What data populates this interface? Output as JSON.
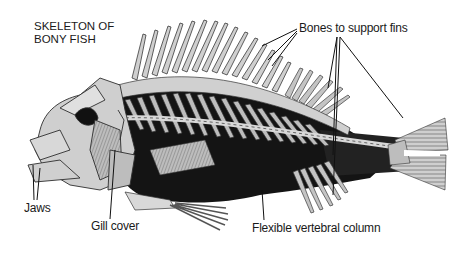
{
  "diagram": {
    "title_line1": "SKELETON OF",
    "title_line2": "BONY FISH",
    "labels": {
      "fins": "Bones to support fins",
      "jaws": "Jaws",
      "gill_cover": "Gill cover",
      "vertebral_column": "Flexible vertebral column"
    },
    "colors": {
      "bone": "#c8c8c8",
      "bone_outline": "#3a3a3a",
      "body_dark": "#111111",
      "text": "#1a1a1a",
      "background": "#ffffff"
    }
  }
}
